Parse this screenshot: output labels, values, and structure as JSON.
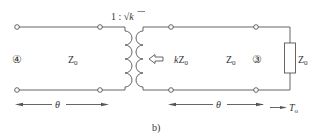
{
  "figure": {
    "caption": "b)",
    "transformer_ratio": "1 : √k",
    "transformer_ratio_parts": {
      "left": "1 :",
      "sqrt": "√",
      "k": "k"
    }
  },
  "left_line": {
    "port_label": "④",
    "impedance": {
      "main": "Z",
      "sub": "0"
    },
    "length": "θ"
  },
  "right_line": {
    "referred_impedance": {
      "prefix": "k",
      "main": "Z",
      "sub": "0"
    },
    "impedance": {
      "main": "Z",
      "sub": "0"
    },
    "port_label": "③",
    "length": "θ"
  },
  "load": {
    "impedance": {
      "main": "Z",
      "sub": "0"
    }
  },
  "reference": {
    "label": {
      "main": "T",
      "sub": "o"
    }
  },
  "colors": {
    "line": "#555555",
    "text": "#333333"
  }
}
